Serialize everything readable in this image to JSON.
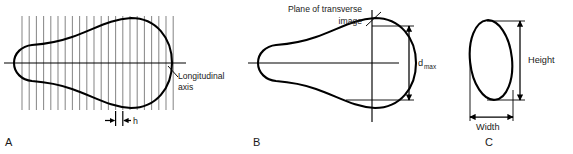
{
  "figure": {
    "width": 573,
    "height": 154,
    "background": "#ffffff",
    "stroke_color": "#000000",
    "slice_color": "#8a8a8a",
    "text_color": "#1a1a1a"
  },
  "panels": [
    {
      "id": "A",
      "letter": "A",
      "letter_x": 5,
      "letter_y": 146,
      "description": "Longitudinal view of organ with parallel transverse slice planes spaced h apart",
      "labels": {
        "axis_line1": "Longitudinal",
        "axis_line2": "axis",
        "axis_label_x": 178,
        "axis_label_y1": 79,
        "axis_label_y2": 90,
        "spacing": "h",
        "spacing_label_x": 133,
        "spacing_label_y": 125
      },
      "slice_spacing": 7.2,
      "slice_count": 24,
      "slice_top": 16,
      "slice_bottom": 110,
      "axis_y": 63,
      "axis_x_start": 4,
      "axis_x_end": 186
    },
    {
      "id": "B",
      "letter": "B",
      "letter_x": 253,
      "letter_y": 146,
      "description": "Longitudinal view with plane of transverse image and maximum diameter",
      "labels": {
        "plane_line1": "Plane of transverse",
        "plane_line2": "image",
        "plane_label_x": 362,
        "plane_label_y1": 12,
        "plane_label_y2": 24,
        "dmax_base": "d",
        "dmax_sub": "max",
        "dmax_label_x": 418,
        "dmax_label_y": 66
      },
      "axis_y": 63,
      "axis_x_start": 248,
      "axis_x_end": 399,
      "plane_x": 372,
      "plane_y_top": 10,
      "plane_y_bottom": 122,
      "dim_x": 409,
      "dim_y_top": 26,
      "dim_y_bottom": 100
    },
    {
      "id": "C",
      "letter": "C",
      "letter_x": 485,
      "letter_y": 146,
      "description": "Transverse image showing height and width of the cross section",
      "labels": {
        "height": "Height",
        "height_label_x": 528,
        "height_label_y": 63,
        "width": "Width",
        "width_label_x": 476,
        "width_label_y": 130
      },
      "ellipse_cx": 491,
      "ellipse_cy": 60,
      "ellipse_rx": 21,
      "ellipse_ry": 40,
      "height_dim_x": 520,
      "height_dim_y_top": 21,
      "height_dim_y_bottom": 100,
      "width_dim_y": 117,
      "width_dim_x_left": 470,
      "width_dim_x_right": 513
    }
  ]
}
